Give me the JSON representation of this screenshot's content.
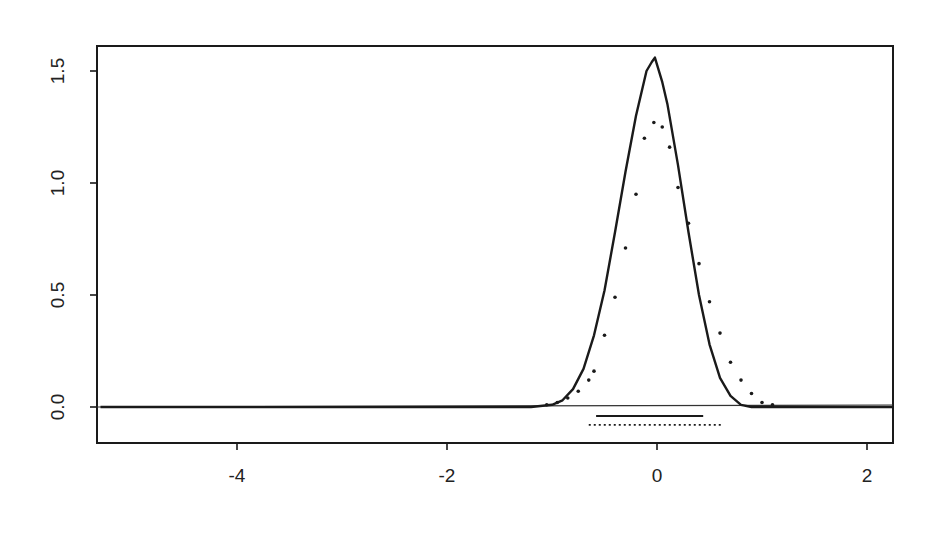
{
  "chart_data": {
    "type": "line",
    "title": "",
    "xlabel": "",
    "ylabel": "",
    "xlim": [
      -5.3,
      2.25
    ],
    "ylim": [
      -0.16,
      1.61
    ],
    "grid": false,
    "legend": null,
    "x_ticks": [
      -4,
      -2,
      0,
      2
    ],
    "x_tick_labels": [
      "-4",
      "-2",
      "0",
      "2"
    ],
    "y_ticks": [
      0.0,
      0.5,
      1.0,
      1.5
    ],
    "y_tick_labels": [
      "0.0",
      "0.5",
      "1.0",
      "1.5"
    ],
    "baseline": {
      "y": 0.0,
      "style": "solid-thin"
    },
    "series": [
      {
        "name": "solid density",
        "style": "solid",
        "x": [
          -5.3,
          -1.2,
          -1.0,
          -0.9,
          -0.8,
          -0.7,
          -0.6,
          -0.5,
          -0.4,
          -0.3,
          -0.2,
          -0.1,
          -0.05,
          -0.02,
          0.05,
          0.1,
          0.2,
          0.3,
          0.4,
          0.5,
          0.6,
          0.7,
          0.8,
          0.9,
          1.0,
          2.25
        ],
        "values": [
          0.0,
          0.0,
          0.01,
          0.03,
          0.08,
          0.17,
          0.32,
          0.52,
          0.78,
          1.05,
          1.3,
          1.5,
          1.54,
          1.56,
          1.45,
          1.35,
          1.08,
          0.78,
          0.5,
          0.28,
          0.13,
          0.05,
          0.01,
          0.0,
          0.0,
          0.0
        ]
      },
      {
        "name": "dotted density",
        "style": "dotted",
        "x": [
          -1.05,
          -0.95,
          -0.85,
          -0.75,
          -0.65,
          -0.6,
          -0.5,
          -0.4,
          -0.3,
          -0.2,
          -0.12,
          -0.03,
          0.05,
          0.12,
          0.2,
          0.3,
          0.4,
          0.5,
          0.6,
          0.7,
          0.8,
          0.9,
          1.0,
          1.1
        ],
        "values": [
          0.01,
          0.02,
          0.04,
          0.07,
          0.12,
          0.16,
          0.32,
          0.49,
          0.71,
          0.95,
          1.2,
          1.27,
          1.25,
          1.16,
          0.98,
          0.82,
          0.64,
          0.47,
          0.33,
          0.2,
          0.12,
          0.06,
          0.02,
          0.01
        ]
      }
    ],
    "interval_segments": [
      {
        "name": "solid interval",
        "style": "solid",
        "x_start": -0.58,
        "x_end": 0.44,
        "y": -0.04
      },
      {
        "name": "dotted interval",
        "style": "dotted",
        "x_start": -0.65,
        "x_end": 0.62,
        "y": -0.08
      }
    ]
  },
  "colors": {
    "ink": "#1a1a1a",
    "background": "#ffffff"
  }
}
